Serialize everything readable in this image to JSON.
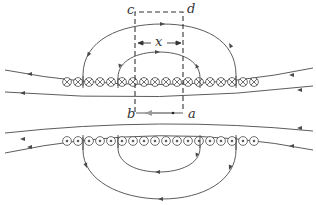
{
  "diagram": {
    "type": "solenoid-cross-section-ampere-loop",
    "colors": {
      "line": "#4a4a4a",
      "dashed": "#333333",
      "arrow_ab": "#9a9a9a",
      "background": "#ffffff"
    },
    "labels": {
      "c": "c",
      "d": "d",
      "a": "a",
      "b": "b",
      "x": "x"
    },
    "upper_row": {
      "symbol": "current-into-page",
      "glyph": "⊗",
      "count": 18
    },
    "lower_row": {
      "symbol": "current-out-of-page",
      "glyph": "⊙",
      "count": 18
    },
    "loop": {
      "corners": [
        "a",
        "b",
        "c",
        "d"
      ],
      "style": "dashed",
      "direction_ab": "a-to-b"
    }
  }
}
